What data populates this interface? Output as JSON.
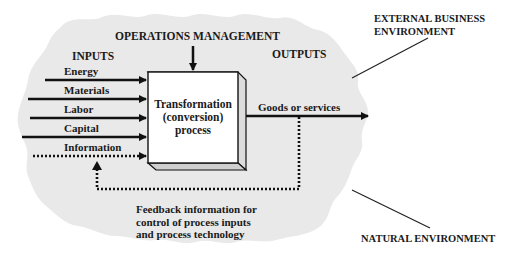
{
  "diagram": {
    "colors": {
      "cloud_fill": "#e8e8e8",
      "box_fill": "#ffffff",
      "box_side": "#d0d0d0",
      "line": "#111111"
    },
    "top_label": "OPERATIONS MANAGEMENT",
    "inputs": {
      "heading": "INPUTS",
      "items": [
        {
          "label": "Energy",
          "style": "solid"
        },
        {
          "label": "Materials",
          "style": "solid"
        },
        {
          "label": "Labor",
          "style": "solid"
        },
        {
          "label": "Capital",
          "style": "solid"
        },
        {
          "label": "Information",
          "style": "dotted"
        }
      ]
    },
    "process": {
      "line1": "Transformation",
      "line2": "(conversion)",
      "line3": "process"
    },
    "outputs": {
      "heading": "OUTPUTS",
      "item": "Goods or services"
    },
    "feedback": {
      "line1": "Feedback information for",
      "line2": "control of process inputs",
      "line3": "and process technology"
    },
    "environments": {
      "external_line1": "EXTERNAL BUSINESS",
      "external_line2": "ENVIRONMENT",
      "natural": "NATURAL ENVIRONMENT"
    }
  }
}
